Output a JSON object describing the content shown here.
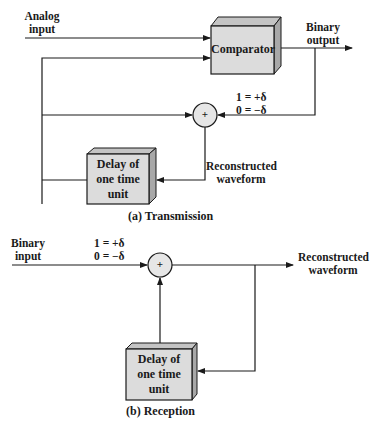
{
  "transmission": {
    "caption": "(a) Transmission",
    "analog_input_line1": "Analog",
    "analog_input_line2": "input",
    "binary_output_line1": "Binary",
    "binary_output_line2": "output",
    "comparator_label": "Comparator",
    "delta_one": "1 = +δ",
    "delta_zero": "0 = −δ",
    "sum_symbol": "+",
    "delay_line1": "Delay of",
    "delay_line2": "one time",
    "delay_line3": "unit",
    "recon_line1": "Reconstructed",
    "recon_line2": "waveform"
  },
  "reception": {
    "caption": "(b) Reception",
    "binary_input_line1": "Binary",
    "binary_input_line2": "input",
    "delta_one": "1 = +δ",
    "delta_zero": "0 = −δ",
    "sum_symbol": "+",
    "recon_line1": "Reconstructed",
    "recon_line2": "waveform",
    "delay_line1": "Delay of",
    "delay_line2": "one time",
    "delay_line3": "unit"
  },
  "colors": {
    "box_face": "#dcdcdc",
    "box_top": "#c4c4c4",
    "box_side": "#a8a8a8",
    "line": "#1a1a1a",
    "sum_fill": "#e6e6e6"
  }
}
